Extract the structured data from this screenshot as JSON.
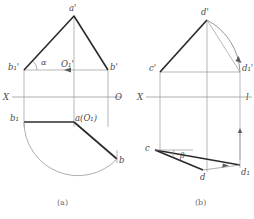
{
  "figure": {
    "caption_a": "(a)",
    "caption_b": "(b)",
    "ground_line_label_left": "X",
    "ground_line_label_right_a": "O",
    "ground_line_label_right_b": "l",
    "colors": {
      "thick_line": "#2b2b2b",
      "thin_line": "#8c8c8c",
      "arc_line": "#8c8c8c",
      "text": "#4a4a4a",
      "caption": "#6b6b6b",
      "background": "#ffffff"
    }
  },
  "diagram_a": {
    "name": "(a)",
    "labels": {
      "apex": "a'",
      "left_rotated": "b₁'",
      "center_axis": "O₁'",
      "right": "b'",
      "angle": "α",
      "plan_left_rotated": "b₁",
      "plan_center": "a(O₁)",
      "plan_right": "b"
    },
    "points": {
      "a_prime": [
        74,
        16
      ],
      "b1_prime": [
        24,
        70
      ],
      "O1_prime": [
        74,
        70
      ],
      "b_prime": [
        108,
        70
      ],
      "b1": [
        24,
        122
      ],
      "a_O1": [
        74,
        122
      ],
      "b": [
        117,
        160
      ]
    },
    "ground_line_y": 97,
    "has_arc": true,
    "arc_from": "b₁",
    "arc_to": "b",
    "arrow_on_segment": "b₁'-O₁'"
  },
  "diagram_b": {
    "name": "(b)",
    "labels": {
      "apex": "d'",
      "left": "c'",
      "right_rotated": "d₁'",
      "angle": "β",
      "plan_left": "c",
      "plan_bottom": "d",
      "plan_right_rotated": "d₁"
    },
    "points": {
      "d_prime": [
        207,
        20
      ],
      "c_prime": [
        160,
        72
      ],
      "d1_prime": [
        240,
        72
      ],
      "c": [
        155,
        150
      ],
      "d": [
        203,
        170
      ],
      "d1": [
        240,
        165
      ]
    },
    "ground_line_y": 97,
    "has_arc": true,
    "arc_from": "d'",
    "arc_to": "d₁'",
    "arrow_on_segment": "d-d₁"
  }
}
